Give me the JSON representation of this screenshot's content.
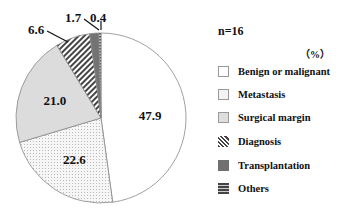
{
  "chart_data": {
    "type": "pie",
    "title": "",
    "sample_size_label": "n=16",
    "unit_label": "（%）",
    "legend_position": "right",
    "categories": [
      "Benign or malignant",
      "Metastasis",
      "Surgical margin",
      "Diagnosis",
      "Transplantation",
      "Others"
    ],
    "values": [
      47.9,
      22.6,
      21.0,
      6.6,
      1.7,
      0.4
    ],
    "value_labels": [
      "47.9",
      "22.6",
      "21.0",
      "6.6",
      "1.7",
      "0.4"
    ],
    "start_angle_deg": 0,
    "direction": "clockwise",
    "fills": [
      "white",
      "light-dotted",
      "light-gray",
      "diagonal-hatch",
      "dark-gray",
      "horizontal-lines"
    ],
    "colors": [
      "#ffffff",
      "#f0f0f0",
      "#dcdcdc",
      "#777777",
      "#777777",
      "#555555"
    ]
  },
  "legend": {
    "n": "n=16",
    "unit": "（%）",
    "items": [
      {
        "label": "Benign or malignant"
      },
      {
        "label": "Metastasis"
      },
      {
        "label": "Surgical margin"
      },
      {
        "label": "Diagnosis"
      },
      {
        "label": "Transplantation"
      },
      {
        "label": "Others"
      }
    ]
  }
}
